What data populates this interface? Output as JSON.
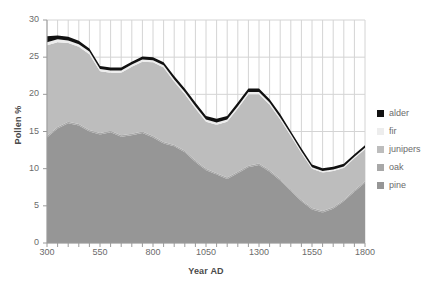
{
  "chart_data": {
    "type": "area",
    "stacked": true,
    "title": "",
    "xlabel": "Year AD",
    "ylabel": "Pollen %",
    "xlim": [
      300,
      1800
    ],
    "ylim": [
      0,
      30
    ],
    "ytick_labels": [
      "0",
      "5",
      "10",
      "15",
      "20",
      "25",
      "30"
    ],
    "ytick_values": [
      0,
      5,
      10,
      15,
      20,
      25,
      30
    ],
    "xtick_labels": [
      "300",
      "550",
      "800",
      "1050",
      "1300",
      "1550",
      "1800"
    ],
    "xtick_values": [
      300,
      550,
      800,
      1050,
      1300,
      1550,
      1800
    ],
    "grid": true,
    "grid_minor_x_step": 50,
    "legend_position": "right",
    "legend_entries": [
      "alder",
      "fir",
      "junipers",
      "oak",
      "pine"
    ],
    "x": [
      300,
      350,
      400,
      450,
      500,
      550,
      600,
      650,
      700,
      750,
      800,
      850,
      900,
      950,
      1000,
      1050,
      1100,
      1150,
      1200,
      1250,
      1300,
      1350,
      1400,
      1450,
      1500,
      1550,
      1600,
      1650,
      1700,
      1750,
      1800
    ],
    "series": [
      {
        "name": "pine",
        "color": "#969696",
        "values": [
          14.2,
          15.4,
          16.1,
          15.8,
          15.0,
          14.6,
          14.9,
          14.3,
          14.5,
          14.8,
          14.2,
          13.4,
          13.0,
          12.2,
          10.9,
          9.8,
          9.2,
          8.6,
          9.4,
          10.2,
          10.5,
          9.6,
          8.4,
          7.0,
          5.6,
          4.5,
          4.1,
          4.6,
          5.6,
          6.9,
          8.1
        ]
      },
      {
        "name": "oak",
        "color": "#a8a8a8",
        "values": [
          0.2,
          0.2,
          0.2,
          0.2,
          0.2,
          0.2,
          0.2,
          0.2,
          0.2,
          0.2,
          0.2,
          0.2,
          0.2,
          0.2,
          0.2,
          0.2,
          0.2,
          0.2,
          0.2,
          0.2,
          0.2,
          0.2,
          0.2,
          0.2,
          0.2,
          0.2,
          0.2,
          0.2,
          0.2,
          0.2,
          0.2
        ]
      },
      {
        "name": "junipers",
        "color": "#bdbdbd",
        "values": [
          12.2,
          11.4,
          10.6,
          10.4,
          10.2,
          8.3,
          7.8,
          8.4,
          9.0,
          9.4,
          9.9,
          10.0,
          8.5,
          7.6,
          7.0,
          6.3,
          6.5,
          7.5,
          8.5,
          9.6,
          9.3,
          8.8,
          8.0,
          7.2,
          6.3,
          5.3,
          5.2,
          4.9,
          4.3,
          4.3,
          4.3
        ]
      },
      {
        "name": "fir",
        "color": "#ededed",
        "values": [
          0.4,
          0.4,
          0.35,
          0.35,
          0.35,
          0.3,
          0.3,
          0.3,
          0.3,
          0.3,
          0.3,
          0.3,
          0.3,
          0.3,
          0.3,
          0.3,
          0.3,
          0.3,
          0.3,
          0.3,
          0.3,
          0.3,
          0.3,
          0.25,
          0.25,
          0.2,
          0.2,
          0.2,
          0.2,
          0.2,
          0.2
        ]
      },
      {
        "name": "alder",
        "color": "#111111",
        "values": [
          0.8,
          0.5,
          0.5,
          0.45,
          0.4,
          0.4,
          0.4,
          0.4,
          0.4,
          0.4,
          0.4,
          0.4,
          0.45,
          0.5,
          0.5,
          0.5,
          0.5,
          0.5,
          0.5,
          0.5,
          0.5,
          0.45,
          0.45,
          0.4,
          0.4,
          0.35,
          0.35,
          0.35,
          0.35,
          0.35,
          0.35
        ]
      }
    ]
  },
  "axes": {
    "y_title": "Pollen %",
    "x_title": "Year AD"
  },
  "colors": {
    "alder": "#111111",
    "fir": "#ededed",
    "junipers": "#bdbdbd",
    "oak": "#a8a8a8",
    "pine": "#969696",
    "grid": "#d4d4d4",
    "axis": "#9a9a9a",
    "tick_text": "#6b6b6b",
    "title_text": "#4a4a4a"
  }
}
